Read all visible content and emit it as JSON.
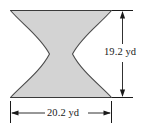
{
  "figure": {
    "kind": "geometry-diagram",
    "shape_name": "concave-hourglass-region",
    "fill_color": "#d3d3d3",
    "outline_color": "#4a4a4a",
    "background_color": "#ffffff",
    "dimension_color": "#1a1a1a"
  },
  "dimensions": {
    "height": {
      "value": "19.2",
      "unit": "yd",
      "label": "19.2 yd",
      "orientation": "vertical",
      "position": "right"
    },
    "width": {
      "value": "20.2",
      "unit": "yd",
      "label": "20.2 yd",
      "orientation": "horizontal",
      "position": "bottom"
    }
  },
  "geometry": {
    "box_left_px": 10,
    "box_right_px": 112,
    "box_top_px": 10,
    "box_bottom_px": 98,
    "waist_left_px": 48,
    "waist_right_px": 72,
    "waist_y_px": 54,
    "vertical_dim_x_px": 122,
    "horizontal_dim_y_px": 113
  }
}
